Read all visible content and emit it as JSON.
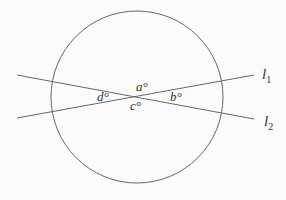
{
  "diagram": {
    "type": "geometry",
    "colors": {
      "stroke": "#666666",
      "text": "#333333",
      "background": "#fbfbfb"
    },
    "circle": {
      "cx": 137,
      "cy": 97,
      "r": 86
    },
    "lines": [
      {
        "id": "l1",
        "x1": 17,
        "y1": 118,
        "x2": 254,
        "y2": 75,
        "label": "l",
        "subscript": "1",
        "label_x": 262,
        "label_y": 79
      },
      {
        "id": "l2",
        "x1": 17,
        "y1": 75,
        "x2": 254,
        "y2": 119,
        "label": "l",
        "subscript": "2",
        "label_x": 264,
        "label_y": 126
      }
    ],
    "angles": [
      {
        "id": "a",
        "text": "a°",
        "x": 136,
        "y": 91
      },
      {
        "id": "b",
        "text": "b°",
        "x": 170,
        "y": 101
      },
      {
        "id": "c",
        "text": "c°",
        "x": 130,
        "y": 110
      },
      {
        "id": "d",
        "text": "d°",
        "x": 97,
        "y": 101
      }
    ]
  }
}
